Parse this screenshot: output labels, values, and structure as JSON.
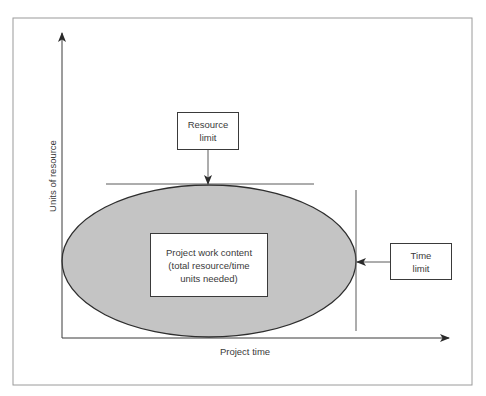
{
  "diagram": {
    "type": "project-constraints-diagram",
    "axes": {
      "x_label": "Project time",
      "y_label": "Units of resource"
    },
    "boxes": {
      "resource_limit": {
        "line1": "Resource",
        "line2": "limit"
      },
      "time_limit": {
        "line1": "Time",
        "line2": "limit"
      },
      "work_content": {
        "line1": "Project work content",
        "line2": "(total resource/time",
        "line3": "units needed)"
      }
    },
    "colors": {
      "ellipse_fill": "#c4c4c4",
      "line": "#3a3a3a",
      "frame": "#9a9a9a",
      "box_fill": "#ffffff"
    }
  }
}
